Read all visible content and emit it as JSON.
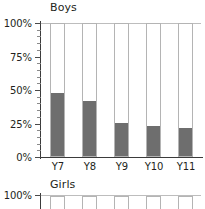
{
  "chart_data": [
    {
      "type": "bar",
      "title": "Boys",
      "categories": [
        "Y7",
        "Y8",
        "Y9",
        "Y10",
        "Y11"
      ],
      "values": [
        48,
        42,
        25,
        23,
        21
      ],
      "series": [
        {
          "name": "filled",
          "values": [
            48,
            42,
            25,
            23,
            21
          ]
        },
        {
          "name": "remainder",
          "values": [
            52,
            58,
            75,
            77,
            79
          ]
        }
      ],
      "xlabel": "",
      "ylabel": "",
      "ylim": [
        0,
        100
      ],
      "ytick_labels": [
        "0%",
        "25%",
        "50%",
        "75%",
        "100%"
      ],
      "ytick_values": [
        0,
        25,
        50,
        75,
        100
      ],
      "minor_ticks": true,
      "grid": false,
      "legend": "none",
      "stacked": true,
      "bar_color": "#6e6e6e",
      "bar_outline_color": "#b4b4b4",
      "axis_color": "#3b3b3b"
    },
    {
      "type": "bar",
      "title": "Girls",
      "categories": [
        "Y7",
        "Y8",
        "Y9",
        "Y10",
        "Y11"
      ],
      "values": [
        null,
        null,
        null,
        null,
        null
      ],
      "xlabel": "",
      "ylabel": "",
      "ylim": [
        0,
        100
      ],
      "ytick_labels": [
        "100%"
      ],
      "ytick_values": [
        100
      ],
      "grid": false,
      "legend": "none",
      "stacked": true,
      "clipped": true,
      "note": "panel cut off at image bottom edge"
    }
  ],
  "boys": {
    "title": "Boys",
    "y_axis": {
      "labels": [
        "100%",
        "75%",
        "50%",
        "25%",
        "0%"
      ]
    },
    "x_axis": {
      "labels": [
        "Y7",
        "Y8",
        "Y9",
        "Y10",
        "Y11"
      ]
    }
  },
  "girls": {
    "title": "Girls",
    "y_axis": {
      "labels": [
        "100%"
      ]
    }
  }
}
